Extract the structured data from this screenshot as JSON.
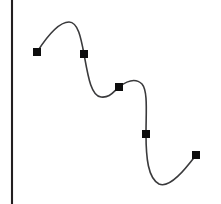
{
  "chart_data": {
    "type": "line",
    "title": "",
    "subtitle": "",
    "xlabel": "",
    "ylabel": "",
    "x": [
      37,
      84,
      119,
      146,
      196
    ],
    "values": [
      52,
      54,
      87,
      134,
      155
    ],
    "series": [
      {
        "name": "series-1",
        "values": [
          52,
          54,
          87,
          134,
          155
        ],
        "marker": "square",
        "marker_size": 8,
        "marker_color": "#0d0d0d",
        "line_color": "#3a3a3c",
        "line_style": "smooth-spline",
        "line_width": 1.6
      }
    ],
    "categories": [
      "1",
      "2",
      "3",
      "4",
      "5"
    ],
    "xlim": [
      0,
      221
    ],
    "ylim": [
      204,
      0
    ],
    "grid": false,
    "legend": false,
    "legend_position": "none",
    "axes": {
      "y_axis_visible": true,
      "y_axis_x": 12,
      "y_axis_top": 0,
      "y_axis_bottom": 204,
      "y_axis_color": "#231f20",
      "x_axis_visible": false,
      "ticks": [],
      "tick_labels": []
    },
    "annotations": [],
    "background_color": "#ffffff"
  },
  "geometry": {
    "width": 221,
    "height": 204,
    "axis": {
      "x": 12,
      "y1": 0,
      "y2": 204
    },
    "markers": [
      {
        "name": "data-point-1",
        "cx": 37,
        "cy": 52,
        "size": 8
      },
      {
        "name": "data-point-2",
        "cx": 84,
        "cy": 54,
        "size": 8
      },
      {
        "name": "data-point-3",
        "cx": 119,
        "cy": 87,
        "size": 8
      },
      {
        "name": "data-point-4",
        "cx": 146,
        "cy": 134,
        "size": 8
      },
      {
        "name": "data-point-5",
        "cx": 196,
        "cy": 155,
        "size": 8
      }
    ],
    "spline_path": "M 37 52 C 46 38 58 22 69 22 C 78 22 81 38 84 54 C 88 76 91 96 101 97 C 110 98 113 92 119 87 C 128 80 136 78 142 84 C 148 91 146 112 146 134 C 146 158 148 178 159 184 C 170 189 186 168 196 155"
  }
}
